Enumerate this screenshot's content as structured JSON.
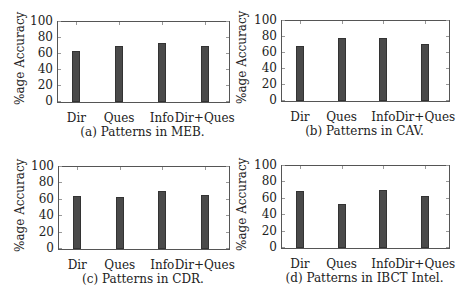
{
  "chart_data": [
    {
      "type": "bar",
      "title": "",
      "caption": "(a) Patterns in MEB.",
      "categories": [
        "Dir",
        "Ques",
        "Info",
        "Dir+Ques"
      ],
      "values": [
        62,
        69,
        73,
        69
      ],
      "xlabel": "",
      "ylabel": "%age Accuracy",
      "ylim": [
        0,
        100
      ],
      "yticks": [
        0,
        20,
        40,
        60,
        80,
        100
      ],
      "grid": false,
      "legend": null
    },
    {
      "type": "bar",
      "title": "",
      "caption": "(b) Patterns in CAV.",
      "categories": [
        "Dir",
        "Ques",
        "Info",
        "Dir+Ques"
      ],
      "values": [
        67,
        77,
        77,
        70
      ],
      "xlabel": "",
      "ylabel": "%age Accuracy",
      "ylim": [
        0,
        100
      ],
      "yticks": [
        0,
        20,
        40,
        60,
        80,
        100
      ],
      "grid": false,
      "legend": null
    },
    {
      "type": "bar",
      "title": "",
      "caption": "(c) Patterns in CDR.",
      "categories": [
        "Dir",
        "Ques",
        "Info",
        "Dir+Ques"
      ],
      "values": [
        64,
        62,
        70,
        65
      ],
      "xlabel": "",
      "ylabel": "%age Accuracy",
      "ylim": [
        0,
        100
      ],
      "yticks": [
        0,
        20,
        40,
        60,
        80,
        100
      ],
      "grid": false,
      "legend": null
    },
    {
      "type": "bar",
      "title": "",
      "caption": "(d) Patterns in IBCT Intel.",
      "categories": [
        "Dir",
        "Ques",
        "Info",
        "Dir+Ques"
      ],
      "values": [
        68,
        53,
        69,
        62
      ],
      "xlabel": "",
      "ylabel": "%age Accuracy",
      "ylim": [
        0,
        100
      ],
      "yticks": [
        0,
        20,
        40,
        60,
        80,
        100
      ],
      "grid": false,
      "legend": null
    }
  ],
  "colors": {
    "bar_fill": "#4a4a4a",
    "bar_edge": "#333333",
    "axis": "#555555"
  }
}
